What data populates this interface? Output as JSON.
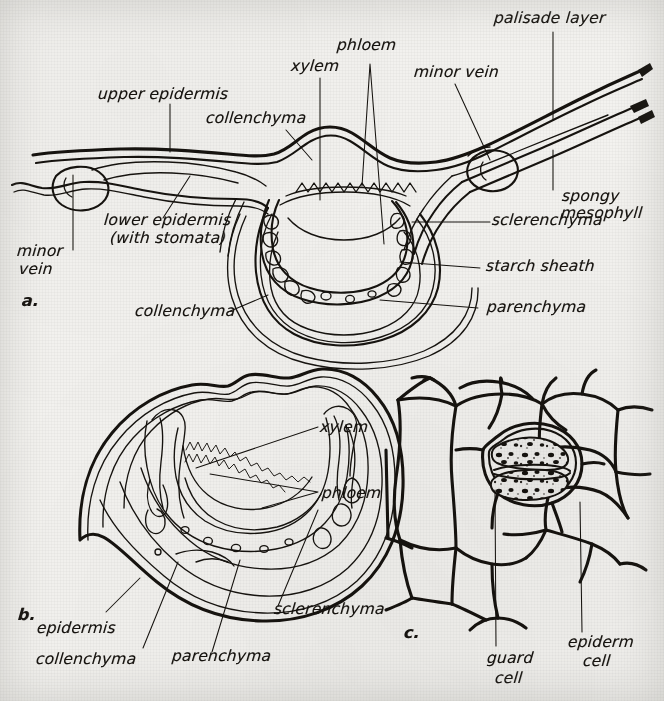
{
  "figure": {
    "background_color": "#f3f2ef",
    "ink_color": "#16130f"
  },
  "panels": [
    {
      "id": "a",
      "marker": "a.",
      "caption": "Cross section through leaf blade and midrib",
      "labels": [
        {
          "name": "upper-epidermis",
          "text": "upper epidermis"
        },
        {
          "name": "collenchyma-top",
          "text": "collenchyma"
        },
        {
          "name": "xylem-a",
          "text": "xylem"
        },
        {
          "name": "phloem-a",
          "text": "phloem"
        },
        {
          "name": "minor-vein-right",
          "text": "minor vein"
        },
        {
          "name": "palisade-layer",
          "text": "palisade layer"
        },
        {
          "name": "spongy-mesophyll",
          "text": "spongy\nmesophyll"
        },
        {
          "name": "sclerenchyma-a",
          "text": "sclerenchyma"
        },
        {
          "name": "starch-sheath",
          "text": "starch sheath"
        },
        {
          "name": "parenchyma-a",
          "text": "parenchyma"
        },
        {
          "name": "collenchyma-bottom",
          "text": "collenchyma"
        },
        {
          "name": "lower-epidermis",
          "text": "lower epidermis\n(with stomata)"
        },
        {
          "name": "minor-vein-left",
          "text": "minor\nvein"
        }
      ]
    },
    {
      "id": "b",
      "marker": "b.",
      "caption": "Cross section of petiole or midrib",
      "labels": [
        {
          "name": "xylem-b",
          "text": "xylem"
        },
        {
          "name": "phloem-b",
          "text": "phloem"
        },
        {
          "name": "sclerenchyma-b",
          "text": "sclerenchyma"
        },
        {
          "name": "parenchyma-b",
          "text": "parenchyma"
        },
        {
          "name": "collenchyma-b",
          "text": "collenchyma"
        },
        {
          "name": "epidermis-b",
          "text": "epidermis"
        }
      ]
    },
    {
      "id": "c",
      "marker": "c.",
      "caption": "Surface view of epidermis with a stoma",
      "labels": [
        {
          "name": "guard-cell",
          "text": "guard\ncell"
        },
        {
          "name": "epiderm-cell",
          "text": "epiderm\ncell"
        }
      ]
    }
  ],
  "label_text": {
    "upper_epidermis": "upper epidermis",
    "collenchyma_top": "collenchyma",
    "xylem_a": "xylem",
    "phloem_a": "phloem",
    "minor_vein_right": "minor vein",
    "palisade_layer": "palisade layer",
    "spongy_mesophyll_1": "spongy",
    "spongy_mesophyll_2": "mesophyll",
    "sclerenchyma_a": "sclerenchyma",
    "starch_sheath": "starch sheath",
    "parenchyma_a": "parenchyma",
    "collenchyma_bottom": "collenchyma",
    "lower_epidermis_1": "lower epidermis",
    "lower_epidermis_2": "(with stomata)",
    "minor_vein_left_1": "minor",
    "minor_vein_left_2": "vein",
    "fig_a": "a.",
    "xylem_b": "xylem",
    "phloem_b": "phloem",
    "sclerenchyma_b": "sclerenchyma",
    "parenchyma_b": "parenchyma",
    "collenchyma_b": "collenchyma",
    "epidermis_b": "epidermis",
    "fig_b": "b.",
    "guard_cell_1": "guard",
    "guard_cell_2": "cell",
    "epiderm_cell_1": "epiderm",
    "epiderm_cell_2": "cell",
    "fig_c": "c."
  }
}
